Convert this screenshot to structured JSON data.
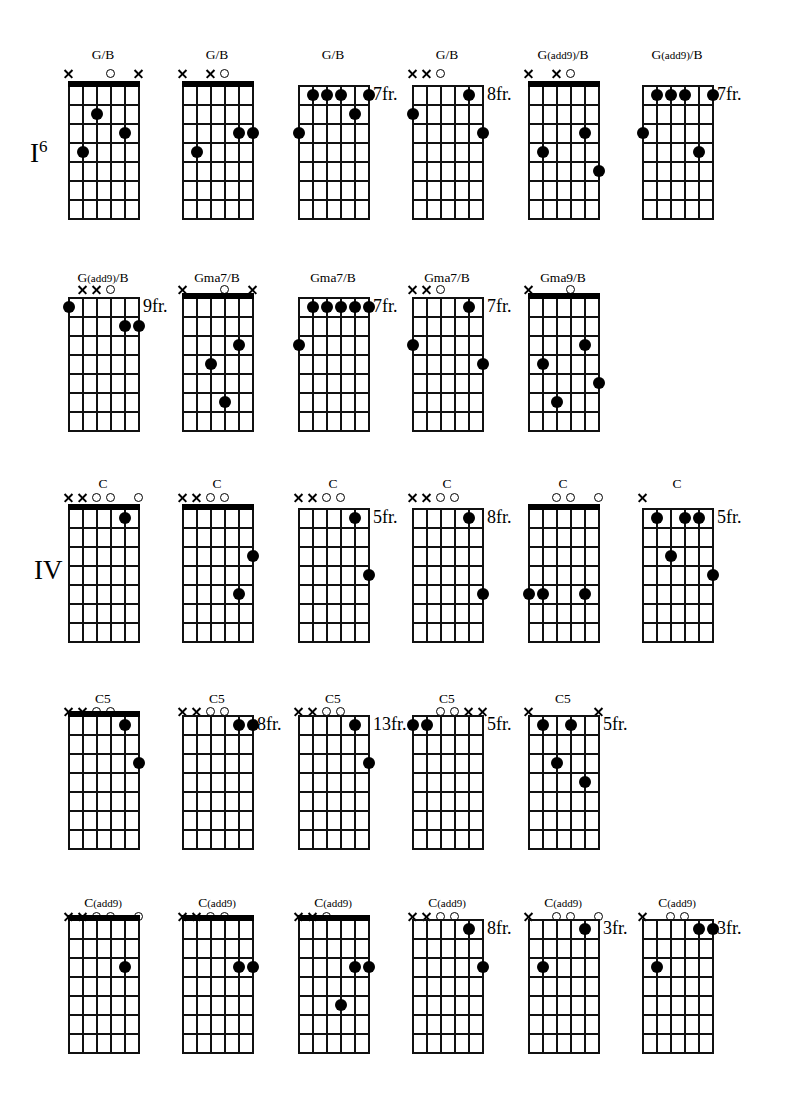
{
  "page": {
    "width": 793,
    "height": 1103,
    "background": "#ffffff",
    "ink": "#000000"
  },
  "section_labels": [
    {
      "name": "degree-label-I6",
      "text": "I",
      "sup": "6",
      "x": 30,
      "y": 140
    },
    {
      "name": "degree-label-IV",
      "text": "IV",
      "sup": "",
      "x": 34,
      "y": 557
    }
  ],
  "grid_spec": {
    "strings": 6,
    "frets": 7,
    "width": 70,
    "height": 133,
    "string_gap": 14,
    "fret_gap": 19,
    "note": "string 1 (high E) is rightmost column line; string 6 (low E) is leftmost"
  },
  "rows": [
    {
      "y": 85,
      "label_y": 48,
      "marker_y": 68
    },
    {
      "y": 297,
      "label_y": 271,
      "marker_y": 284
    },
    {
      "y": 508,
      "label_y": 477,
      "marker_y": 492
    },
    {
      "y": 715,
      "label_y": 692,
      "marker_y": 706
    },
    {
      "y": 919,
      "label_y": 896,
      "marker_y": 911
    }
  ],
  "columns": [
    68,
    182,
    298,
    412,
    528,
    642
  ],
  "diagrams": [
    {
      "id": "c1",
      "name": "G/B",
      "display": "G/B",
      "row": 0,
      "col": 0,
      "open_nut": true,
      "fret_label": "",
      "markers": [
        {
          "string": 6,
          "type": "x"
        },
        {
          "string": 3,
          "type": "o"
        },
        {
          "string": 1,
          "type": "x"
        }
      ],
      "dots": [
        {
          "string": 4,
          "fret": 2
        },
        {
          "string": 2,
          "fret": 3
        },
        {
          "string": 5,
          "fret": 4
        }
      ]
    },
    {
      "id": "c2",
      "name": "G/B",
      "display": "G/B",
      "row": 0,
      "col": 1,
      "open_nut": true,
      "fret_label": "",
      "markers": [
        {
          "string": 6,
          "type": "x"
        },
        {
          "string": 4,
          "type": "x"
        },
        {
          "string": 3,
          "type": "o"
        }
      ],
      "dots": [
        {
          "string": 2,
          "fret": 3
        },
        {
          "string": 1,
          "fret": 3
        },
        {
          "string": 5,
          "fret": 4
        }
      ]
    },
    {
      "id": "c3",
      "name": "G/B",
      "display": "G/B",
      "row": 0,
      "col": 2,
      "open_nut": false,
      "fret_label": "7fr.",
      "markers": [],
      "dots": [
        {
          "string": 5,
          "fret": 1
        },
        {
          "string": 4,
          "fret": 1
        },
        {
          "string": 3,
          "fret": 1
        },
        {
          "string": 1,
          "fret": 1
        },
        {
          "string": 2,
          "fret": 2
        },
        {
          "string": 6,
          "fret": 3
        }
      ]
    },
    {
      "id": "c4",
      "name": "G/B",
      "display": "G/B",
      "row": 0,
      "col": 3,
      "open_nut": false,
      "fret_label": "8fr.",
      "markers": [
        {
          "string": 6,
          "type": "x"
        },
        {
          "string": 5,
          "type": "x"
        },
        {
          "string": 4,
          "type": "o"
        }
      ],
      "dots": [
        {
          "string": 2,
          "fret": 1
        },
        {
          "string": 6,
          "fret": 2
        },
        {
          "string": 1,
          "fret": 3
        }
      ]
    },
    {
      "id": "c5",
      "name": "G(add9)/B",
      "display": "G(add9)/B",
      "row": 0,
      "col": 4,
      "open_nut": true,
      "fret_label": "",
      "markers": [
        {
          "string": 6,
          "type": "x"
        },
        {
          "string": 4,
          "type": "x"
        },
        {
          "string": 3,
          "type": "o"
        }
      ],
      "dots": [
        {
          "string": 2,
          "fret": 3
        },
        {
          "string": 5,
          "fret": 4
        },
        {
          "string": 1,
          "fret": 5
        }
      ]
    },
    {
      "id": "c6",
      "name": "G(add9)/B",
      "display": "G(add9)/B",
      "row": 0,
      "col": 5,
      "open_nut": false,
      "fret_label": "7fr.",
      "markers": [],
      "dots": [
        {
          "string": 5,
          "fret": 1
        },
        {
          "string": 4,
          "fret": 1
        },
        {
          "string": 3,
          "fret": 1
        },
        {
          "string": 1,
          "fret": 1
        },
        {
          "string": 6,
          "fret": 3
        },
        {
          "string": 2,
          "fret": 4
        }
      ]
    },
    {
      "id": "c7",
      "name": "G(add9)/B",
      "display": "G(add9)/B",
      "row": 1,
      "col": 0,
      "open_nut": false,
      "fret_label": "9fr.",
      "markers": [
        {
          "string": 5,
          "type": "x"
        },
        {
          "string": 4,
          "type": "x"
        },
        {
          "string": 3,
          "type": "o"
        }
      ],
      "dots": [
        {
          "string": 6,
          "fret": 1
        },
        {
          "string": 2,
          "fret": 2
        },
        {
          "string": 1,
          "fret": 2
        }
      ]
    },
    {
      "id": "c8",
      "name": "Gma7/B",
      "display": "Gma7/B",
      "row": 1,
      "col": 1,
      "open_nut": true,
      "fret_label": "",
      "markers": [
        {
          "string": 6,
          "type": "x"
        },
        {
          "string": 3,
          "type": "o"
        },
        {
          "string": 1,
          "type": "x"
        }
      ],
      "dots": [
        {
          "string": 2,
          "fret": 3
        },
        {
          "string": 4,
          "fret": 4
        },
        {
          "string": 3,
          "fret": 6
        }
      ]
    },
    {
      "id": "c9",
      "name": "Gma7/B",
      "display": "Gma7/B",
      "row": 1,
      "col": 2,
      "open_nut": false,
      "fret_label": "7fr.",
      "markers": [],
      "dots": [
        {
          "string": 5,
          "fret": 1
        },
        {
          "string": 4,
          "fret": 1
        },
        {
          "string": 3,
          "fret": 1
        },
        {
          "string": 2,
          "fret": 1
        },
        {
          "string": 1,
          "fret": 1
        },
        {
          "string": 6,
          "fret": 3
        }
      ]
    },
    {
      "id": "c10",
      "name": "Gma7/B",
      "display": "Gma7/B",
      "row": 1,
      "col": 3,
      "open_nut": false,
      "fret_label": "7fr.",
      "markers": [
        {
          "string": 6,
          "type": "x"
        },
        {
          "string": 5,
          "type": "x"
        },
        {
          "string": 4,
          "type": "o"
        }
      ],
      "dots": [
        {
          "string": 2,
          "fret": 1
        },
        {
          "string": 6,
          "fret": 3
        },
        {
          "string": 1,
          "fret": 4
        }
      ]
    },
    {
      "id": "c11",
      "name": "Gma9/B",
      "display": "Gma9/B",
      "row": 1,
      "col": 4,
      "open_nut": true,
      "fret_label": "",
      "markers": [
        {
          "string": 6,
          "type": "x"
        },
        {
          "string": 3,
          "type": "o"
        }
      ],
      "dots": [
        {
          "string": 2,
          "fret": 3
        },
        {
          "string": 5,
          "fret": 4
        },
        {
          "string": 1,
          "fret": 5
        },
        {
          "string": 4,
          "fret": 6
        }
      ]
    },
    {
      "id": "c12",
      "name": "C",
      "display": "C",
      "row": 2,
      "col": 0,
      "open_nut": true,
      "fret_label": "",
      "markers": [
        {
          "string": 6,
          "type": "x"
        },
        {
          "string": 5,
          "type": "x"
        },
        {
          "string": 4,
          "type": "o"
        },
        {
          "string": 3,
          "type": "o"
        },
        {
          "string": 1,
          "type": "o"
        }
      ],
      "dots": [
        {
          "string": 2,
          "fret": 1
        }
      ]
    },
    {
      "id": "c13",
      "name": "C",
      "display": "C",
      "row": 2,
      "col": 1,
      "open_nut": true,
      "fret_label": "",
      "markers": [
        {
          "string": 6,
          "type": "x"
        },
        {
          "string": 5,
          "type": "x"
        },
        {
          "string": 4,
          "type": "o"
        },
        {
          "string": 3,
          "type": "o"
        }
      ],
      "dots": [
        {
          "string": 1,
          "fret": 3
        },
        {
          "string": 2,
          "fret": 5
        }
      ]
    },
    {
      "id": "c14",
      "name": "C",
      "display": "C",
      "row": 2,
      "col": 2,
      "open_nut": false,
      "fret_label": "5fr.",
      "markers": [
        {
          "string": 6,
          "type": "x"
        },
        {
          "string": 5,
          "type": "x"
        },
        {
          "string": 4,
          "type": "o"
        },
        {
          "string": 3,
          "type": "o"
        }
      ],
      "dots": [
        {
          "string": 2,
          "fret": 1
        },
        {
          "string": 1,
          "fret": 4
        }
      ]
    },
    {
      "id": "c15",
      "name": "C",
      "display": "C",
      "row": 2,
      "col": 3,
      "open_nut": false,
      "fret_label": "8fr.",
      "markers": [
        {
          "string": 6,
          "type": "x"
        },
        {
          "string": 5,
          "type": "x"
        },
        {
          "string": 4,
          "type": "o"
        },
        {
          "string": 3,
          "type": "o"
        }
      ],
      "dots": [
        {
          "string": 2,
          "fret": 1
        },
        {
          "string": 1,
          "fret": 5
        }
      ]
    },
    {
      "id": "c16",
      "name": "C",
      "display": "C",
      "row": 2,
      "col": 4,
      "open_nut": true,
      "fret_label": "",
      "markers": [
        {
          "string": 4,
          "type": "o"
        },
        {
          "string": 3,
          "type": "o"
        },
        {
          "string": 1,
          "type": "o"
        }
      ],
      "dots": [
        {
          "string": 6,
          "fret": 5
        },
        {
          "string": 5,
          "fret": 5
        },
        {
          "string": 2,
          "fret": 5
        }
      ]
    },
    {
      "id": "c17",
      "name": "C",
      "display": "C",
      "row": 2,
      "col": 5,
      "open_nut": false,
      "fret_label": "5fr.",
      "markers": [
        {
          "string": 6,
          "type": "x"
        }
      ],
      "dots": [
        {
          "string": 5,
          "fret": 1
        },
        {
          "string": 3,
          "fret": 1
        },
        {
          "string": 2,
          "fret": 1
        },
        {
          "string": 4,
          "fret": 3
        },
        {
          "string": 1,
          "fret": 4
        }
      ]
    },
    {
      "id": "c18",
      "name": "C5",
      "display": "C5",
      "row": 3,
      "col": 0,
      "open_nut": true,
      "fret_label": "",
      "markers": [
        {
          "string": 6,
          "type": "x"
        },
        {
          "string": 5,
          "type": "x"
        },
        {
          "string": 4,
          "type": "o"
        },
        {
          "string": 3,
          "type": "o"
        }
      ],
      "dots": [
        {
          "string": 2,
          "fret": 1
        },
        {
          "string": 1,
          "fret": 3
        }
      ]
    },
    {
      "id": "c19",
      "name": "C5",
      "display": "C5",
      "row": 3,
      "col": 1,
      "open_nut": false,
      "fret_label": "8fr.",
      "markers": [
        {
          "string": 6,
          "type": "x"
        },
        {
          "string": 5,
          "type": "x"
        },
        {
          "string": 4,
          "type": "o"
        },
        {
          "string": 3,
          "type": "o"
        }
      ],
      "dots": [
        {
          "string": 2,
          "fret": 1
        },
        {
          "string": 1,
          "fret": 1
        }
      ]
    },
    {
      "id": "c20",
      "name": "C5",
      "display": "C5",
      "row": 3,
      "col": 2,
      "open_nut": false,
      "fret_label": "13fr.",
      "markers": [
        {
          "string": 6,
          "type": "x"
        },
        {
          "string": 5,
          "type": "x"
        },
        {
          "string": 4,
          "type": "o"
        },
        {
          "string": 3,
          "type": "o"
        }
      ],
      "dots": [
        {
          "string": 2,
          "fret": 1
        },
        {
          "string": 1,
          "fret": 3
        }
      ]
    },
    {
      "id": "c21",
      "name": "C5",
      "display": "C5",
      "row": 3,
      "col": 3,
      "open_nut": false,
      "fret_label": "5fr.",
      "markers": [
        {
          "string": 4,
          "type": "o"
        },
        {
          "string": 3,
          "type": "o"
        },
        {
          "string": 2,
          "type": "x"
        },
        {
          "string": 1,
          "type": "x"
        }
      ],
      "dots": [
        {
          "string": 6,
          "fret": 1
        },
        {
          "string": 5,
          "fret": 1
        }
      ]
    },
    {
      "id": "c22",
      "name": "C5",
      "display": "C5",
      "row": 3,
      "col": 4,
      "open_nut": false,
      "fret_label": "5fr.",
      "markers": [
        {
          "string": 6,
          "type": "x"
        },
        {
          "string": 1,
          "type": "x"
        }
      ],
      "dots": [
        {
          "string": 5,
          "fret": 1
        },
        {
          "string": 3,
          "fret": 1
        },
        {
          "string": 4,
          "fret": 3
        },
        {
          "string": 2,
          "fret": 4
        }
      ]
    },
    {
      "id": "c23",
      "name": "C(add9)",
      "display": "C(add9)",
      "row": 4,
      "col": 0,
      "open_nut": true,
      "fret_label": "",
      "markers": [
        {
          "string": 6,
          "type": "x"
        },
        {
          "string": 5,
          "type": "x"
        },
        {
          "string": 4,
          "type": "o"
        },
        {
          "string": 3,
          "type": "o"
        },
        {
          "string": 1,
          "type": "o"
        }
      ],
      "dots": [
        {
          "string": 2,
          "fret": 3
        }
      ]
    },
    {
      "id": "c24",
      "name": "C(add9)",
      "display": "C(add9)",
      "row": 4,
      "col": 1,
      "open_nut": true,
      "fret_label": "",
      "markers": [
        {
          "string": 6,
          "type": "x"
        },
        {
          "string": 5,
          "type": "x"
        },
        {
          "string": 4,
          "type": "o"
        },
        {
          "string": 3,
          "type": "o"
        }
      ],
      "dots": [
        {
          "string": 2,
          "fret": 3
        },
        {
          "string": 1,
          "fret": 3
        }
      ]
    },
    {
      "id": "c25",
      "name": "C(add9)",
      "display": "C(add9)",
      "row": 4,
      "col": 2,
      "open_nut": true,
      "fret_label": "",
      "markers": [
        {
          "string": 6,
          "type": "x"
        },
        {
          "string": 5,
          "type": "x"
        },
        {
          "string": 4,
          "type": "o"
        }
      ],
      "dots": [
        {
          "string": 2,
          "fret": 3
        },
        {
          "string": 1,
          "fret": 3
        },
        {
          "string": 3,
          "fret": 5
        }
      ]
    },
    {
      "id": "c26",
      "name": "C(add9)",
      "display": "C(add9)",
      "row": 4,
      "col": 3,
      "open_nut": false,
      "fret_label": "8fr.",
      "markers": [
        {
          "string": 6,
          "type": "x"
        },
        {
          "string": 5,
          "type": "x"
        },
        {
          "string": 4,
          "type": "o"
        },
        {
          "string": 3,
          "type": "o"
        }
      ],
      "dots": [
        {
          "string": 2,
          "fret": 1
        },
        {
          "string": 1,
          "fret": 3
        }
      ]
    },
    {
      "id": "c27",
      "name": "C(add9)",
      "display": "C(add9)",
      "row": 4,
      "col": 4,
      "open_nut": false,
      "fret_label": "3fr.",
      "markers": [
        {
          "string": 6,
          "type": "x"
        },
        {
          "string": 4,
          "type": "o"
        },
        {
          "string": 3,
          "type": "o"
        },
        {
          "string": 1,
          "type": "o"
        }
      ],
      "dots": [
        {
          "string": 2,
          "fret": 1
        },
        {
          "string": 5,
          "fret": 3
        }
      ]
    },
    {
      "id": "c28",
      "name": "C(add9)",
      "display": "C(add9)",
      "row": 4,
      "col": 5,
      "open_nut": false,
      "fret_label": "3fr.",
      "markers": [
        {
          "string": 6,
          "type": "x"
        },
        {
          "string": 4,
          "type": "o"
        },
        {
          "string": 3,
          "type": "o"
        }
      ],
      "dots": [
        {
          "string": 2,
          "fret": 1
        },
        {
          "string": 1,
          "fret": 1
        },
        {
          "string": 5,
          "fret": 3
        }
      ]
    }
  ]
}
